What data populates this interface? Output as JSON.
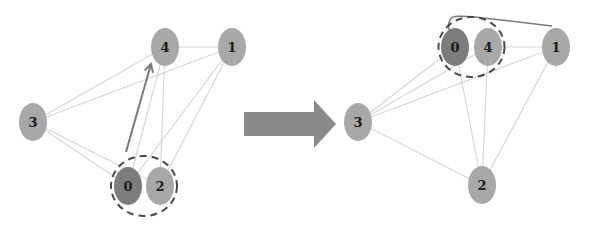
{
  "colors": {
    "node_fill": "#a8a8a8",
    "highlight_node_fill": "#7c7c7c",
    "edge": "#d6d6d6",
    "move_arrow": "#7a7a7a",
    "dashed_cluster": "#4a4a4a",
    "transition_arrow": "#8a8a8a",
    "background": "#ffffff"
  },
  "before_graph": {
    "nodes": [
      {
        "id": "0",
        "label": "0",
        "highlight": true
      },
      {
        "id": "1",
        "label": "1",
        "highlight": false
      },
      {
        "id": "2",
        "label": "2",
        "highlight": false
      },
      {
        "id": "3",
        "label": "3",
        "highlight": false
      },
      {
        "id": "4",
        "label": "4",
        "highlight": false
      }
    ],
    "edges": [
      [
        "3",
        "4"
      ],
      [
        "3",
        "1"
      ],
      [
        "3",
        "0"
      ],
      [
        "3",
        "2"
      ],
      [
        "4",
        "1"
      ],
      [
        "4",
        "0"
      ],
      [
        "4",
        "2"
      ],
      [
        "1",
        "0"
      ],
      [
        "1",
        "2"
      ]
    ],
    "cluster": [
      "0",
      "2"
    ],
    "move": {
      "node": "0",
      "from_cluster": [
        "0",
        "2"
      ],
      "to": "4"
    }
  },
  "transition": {
    "icon": "right-arrow-icon"
  },
  "after_graph": {
    "nodes": [
      {
        "id": "0",
        "label": "0",
        "highlight": true
      },
      {
        "id": "1",
        "label": "1",
        "highlight": false
      },
      {
        "id": "2",
        "label": "2",
        "highlight": false
      },
      {
        "id": "3",
        "label": "3",
        "highlight": false
      },
      {
        "id": "4",
        "label": "4",
        "highlight": false
      }
    ],
    "edges": [
      [
        "3",
        "0"
      ],
      [
        "3",
        "4"
      ],
      [
        "3",
        "1"
      ],
      [
        "3",
        "2"
      ],
      [
        "0",
        "2"
      ],
      [
        "4",
        "2"
      ],
      [
        "4",
        "1"
      ],
      [
        "1",
        "2"
      ]
    ],
    "curved_edges": [
      [
        "0",
        "1"
      ]
    ],
    "cluster": [
      "0",
      "4"
    ]
  }
}
